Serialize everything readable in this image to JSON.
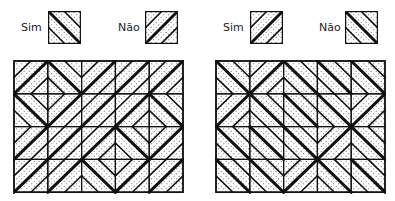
{
  "colors": {
    "ink": "#111111",
    "dot": "#555555",
    "background": "#ffffff"
  },
  "panels": [
    {
      "id": "left",
      "legend": [
        {
          "label": "Sim",
          "direction": "\\"
        },
        {
          "label": "Não",
          "direction": "/"
        }
      ],
      "grid": {
        "rows": 4,
        "cols": 5,
        "cells": [
          [
            "/",
            "\\",
            "/",
            "/",
            "/"
          ],
          [
            "\\",
            "/",
            "/",
            "/",
            "\\"
          ],
          [
            "/",
            "/",
            "/",
            "\\",
            "/"
          ],
          [
            "/",
            "/",
            "\\",
            "/",
            "/"
          ]
        ]
      }
    },
    {
      "id": "right",
      "legend": [
        {
          "label": "Sim",
          "direction": "/"
        },
        {
          "label": "Não",
          "direction": "\\"
        }
      ],
      "grid": {
        "rows": 4,
        "cols": 5,
        "cells": [
          [
            "\\",
            "/",
            "\\",
            "\\",
            "\\"
          ],
          [
            "/",
            "\\",
            "\\",
            "\\",
            "/"
          ],
          [
            "\\",
            "\\",
            "\\",
            "/",
            "\\"
          ],
          [
            "\\",
            "\\",
            "/",
            "\\",
            "\\"
          ]
        ]
      }
    }
  ]
}
